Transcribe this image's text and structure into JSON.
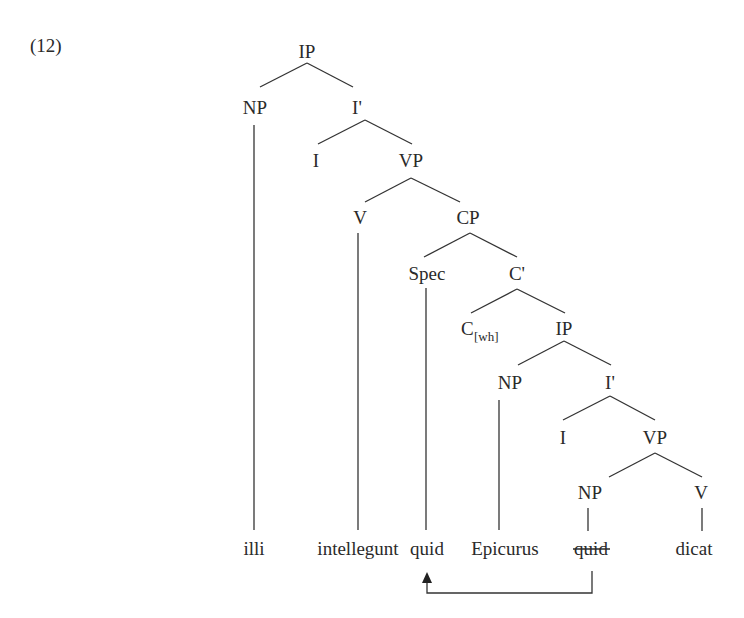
{
  "example_number": "(12)",
  "tree": {
    "root": "IP",
    "nodes": {
      "ip_top": "IP",
      "np_subj": "NP",
      "ibar_top": "I'",
      "i_top": "I",
      "vp_top": "VP",
      "v_top": "V",
      "cp": "CP",
      "spec": "Spec",
      "cbar": "C'",
      "c_wh_base": "C",
      "c_wh_sub": "[wh]",
      "ip_low": "IP",
      "np_low": "NP",
      "ibar_low": "I'",
      "i_low": "I",
      "vp_low": "VP",
      "np_obj": "NP",
      "v_low": "V"
    }
  },
  "words": [
    {
      "text": "illi",
      "struck": false
    },
    {
      "text": "intellegunt",
      "struck": false
    },
    {
      "text": "quid",
      "struck": false
    },
    {
      "text": "Epicurus",
      "struck": false
    },
    {
      "text": "quid",
      "struck": true
    },
    {
      "text": "dicat",
      "struck": false
    }
  ],
  "movement": {
    "from_word_index": 4,
    "to_word_index": 2,
    "arrow": "arrow-up"
  }
}
